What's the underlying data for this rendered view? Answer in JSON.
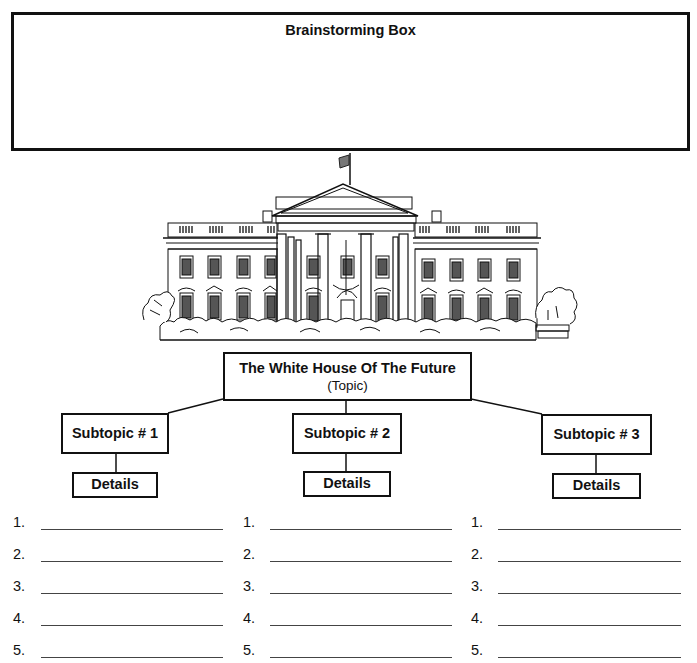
{
  "page": {
    "cut_header_text": "graphic organizer for writing a story",
    "brainstorm": {
      "title": "Brainstorming Box",
      "content": ""
    },
    "illustration": {
      "label": "white-house-illustration"
    },
    "topic": {
      "title": "The White House Of The Future",
      "subtitle": "(Topic)"
    },
    "subtopics": [
      {
        "label": "Subtopic # 1",
        "details_label": "Details",
        "items": [
          "1.",
          "2.",
          "3.",
          "4.",
          "5."
        ]
      },
      {
        "label": "Subtopic # 2",
        "details_label": "Details",
        "items": [
          "1.",
          "2.",
          "3.",
          "4.",
          "5."
        ]
      },
      {
        "label": "Subtopic # 3",
        "details_label": "Details",
        "items": [
          "1.",
          "2.",
          "3.",
          "4.",
          "5."
        ]
      }
    ],
    "colors": {
      "ink": "#111111",
      "paper": "#ffffff"
    }
  }
}
